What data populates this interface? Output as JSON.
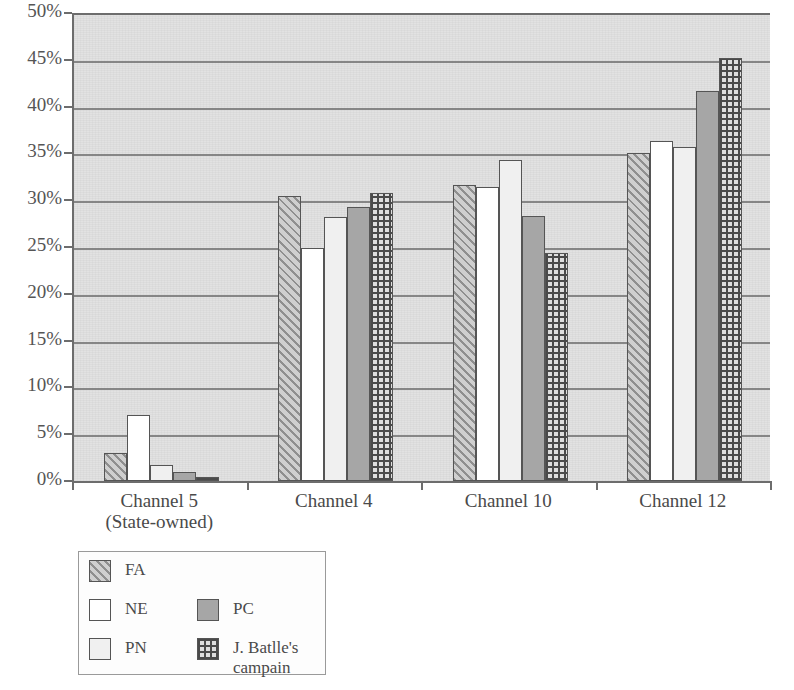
{
  "chart_data": {
    "type": "bar",
    "title": "",
    "subtitle": "",
    "xlabel": "",
    "ylabel": "",
    "ylim": [
      0,
      50
    ],
    "ytick_step": 5,
    "ytick_labels": [
      "0%",
      "5%",
      "10%",
      "15%",
      "20%",
      "25%",
      "30%",
      "35%",
      "40%",
      "45%",
      "50%"
    ],
    "ytick_values": [
      0,
      5,
      10,
      15,
      20,
      25,
      30,
      35,
      40,
      45,
      50
    ],
    "grid": true,
    "grid_axis": "y",
    "legend_position": "below-left",
    "categories": [
      "Channel 5\n(State-owned)",
      "Channel 4",
      "Channel 10",
      "Channel 12"
    ],
    "category_lines": [
      [
        "Channel 5",
        "(State-owned)"
      ],
      [
        "Channel 4"
      ],
      [
        "Channel 10"
      ],
      [
        "Channel 12"
      ]
    ],
    "series": [
      {
        "name": "FA",
        "pattern": "diagonal-hatch",
        "values": [
          3.0,
          30.4,
          31.6,
          35.0
        ]
      },
      {
        "name": "NE",
        "pattern": "solid-white",
        "values": [
          7.1,
          24.9,
          31.4,
          36.3
        ]
      },
      {
        "name": "PN",
        "pattern": "solid-light-gray",
        "values": [
          1.7,
          28.2,
          34.3,
          35.7
        ]
      },
      {
        "name": "PC",
        "pattern": "solid-gray",
        "values": [
          1.0,
          29.3,
          28.3,
          41.7
        ]
      },
      {
        "name": "J. Batlle's\ncampain",
        "pattern": "checkered",
        "values": [
          0.4,
          30.8,
          24.4,
          45.2
        ]
      }
    ]
  },
  "legend": {
    "entries": [
      {
        "label": "FA",
        "pattern": "diagonal-hatch"
      },
      {
        "label": "NE",
        "pattern": "solid-white"
      },
      {
        "label": "PN",
        "pattern": "solid-light-gray"
      },
      {
        "label": "PC",
        "pattern": "solid-gray"
      },
      {
        "label": "J. Batlle's\ncampain",
        "pattern": "checkered"
      }
    ]
  },
  "colors": {
    "plot_background": "#e2e2e2",
    "gridline": "#777777",
    "axis": "#6d6d6d",
    "text": "#4a4a4a",
    "series_fa": "#cfcfcf",
    "series_ne": "#ffffff",
    "series_pn": "#f0f0f0",
    "series_pc": "#a6a6a6",
    "series_jb": "#dedede"
  }
}
